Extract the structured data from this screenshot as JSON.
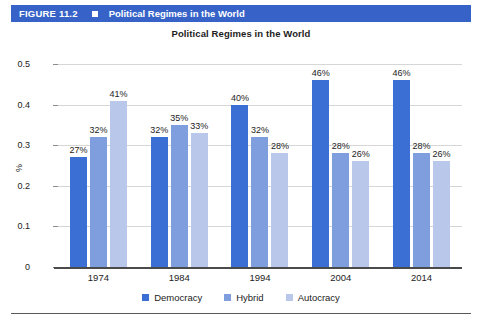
{
  "figure": {
    "number_label": "FIGURE 11.2",
    "marker_icon": "square-icon",
    "header_title": "Political Regimes in the World",
    "header_bg": "#3763c9",
    "header_fg": "#ffffff"
  },
  "chart_data": {
    "type": "bar",
    "title": "Political Regimes in the World",
    "xlabel": "",
    "ylabel": "%",
    "categories": [
      "1974",
      "1984",
      "1994",
      "2004",
      "2014"
    ],
    "ylim": [
      0,
      0.5
    ],
    "yticks": [
      "0",
      "0.1",
      "0.2",
      "0.3",
      "0.4",
      "0.5"
    ],
    "ytick_values": [
      0,
      0.1,
      0.2,
      0.3,
      0.4,
      0.5
    ],
    "grid": true,
    "legend_position": "bottom",
    "series": [
      {
        "name": "Democracy",
        "color": "#3b6fd4",
        "values": [
          0.27,
          0.32,
          0.4,
          0.46,
          0.46
        ],
        "labels": [
          "27%",
          "32%",
          "40%",
          "46%",
          "46%"
        ]
      },
      {
        "name": "Hybrid",
        "color": "#7e9ede",
        "values": [
          0.32,
          0.35,
          0.32,
          0.28,
          0.28
        ],
        "labels": [
          "32%",
          "35%",
          "32%",
          "28%",
          "28%"
        ]
      },
      {
        "name": "Autocracy",
        "color": "#b9c8ea",
        "values": [
          0.41,
          0.33,
          0.28,
          0.26,
          0.26
        ],
        "labels": [
          "41%",
          "33%",
          "28%",
          "26%",
          "26%"
        ]
      }
    ]
  }
}
